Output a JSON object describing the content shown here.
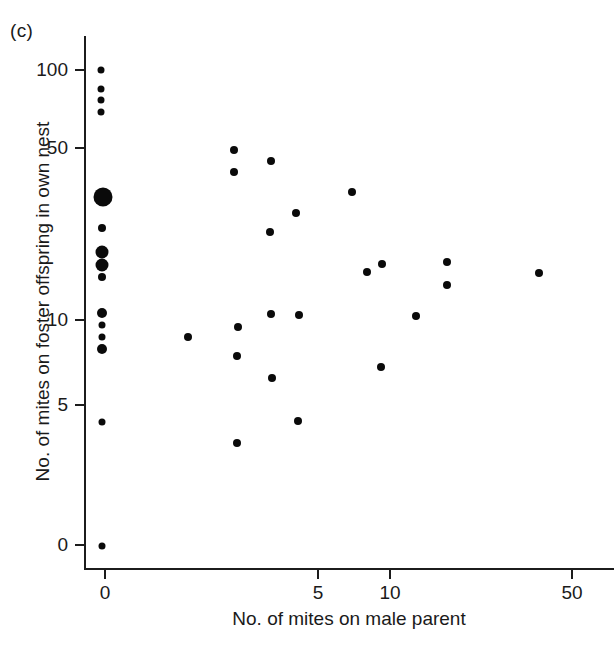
{
  "figure": {
    "panel_label": "(c)"
  },
  "chart_data": {
    "type": "scatter",
    "title": "",
    "xlabel": "No. of mites on male parent",
    "ylabel": "No. of mites on foster offspring in own nest",
    "grid": false,
    "legend": "none",
    "x_scale": "log-like (0 offset, then logarithmic)",
    "y_scale": "log-like (0 offset, then logarithmic)",
    "x_ticks": [
      "0",
      "5",
      "10",
      "50"
    ],
    "x_tick_values": [
      0,
      5,
      10,
      50
    ],
    "y_ticks": [
      "0",
      "5",
      "10",
      "50",
      "100"
    ],
    "y_tick_values": [
      0,
      5,
      10,
      50,
      100
    ],
    "xlim": [
      0,
      50
    ],
    "ylim": [
      0,
      100
    ],
    "point_color": "#0a0a0a",
    "marker_sizes_note": "Marker area encodes number of overlapping observations",
    "points": [
      {
        "x": 0,
        "y": 100,
        "n": 1,
        "px": 101,
        "py": 70,
        "r": 3.5
      },
      {
        "x": 0,
        "y": 85,
        "n": 1,
        "px": 101,
        "py": 89,
        "r": 3.5
      },
      {
        "x": 0,
        "y": 78,
        "n": 1,
        "px": 101,
        "py": 100,
        "r": 3.5
      },
      {
        "x": 0,
        "y": 71,
        "n": 1,
        "px": 101,
        "py": 112,
        "r": 3.5
      },
      {
        "x": 0,
        "y": 35,
        "n": 5,
        "px": 103,
        "py": 197,
        "r": 9.5
      },
      {
        "x": 0,
        "y": 25,
        "n": 1,
        "px": 102,
        "py": 228,
        "r": 4.0
      },
      {
        "x": 0,
        "y": 20,
        "n": 3,
        "px": 102,
        "py": 252,
        "r": 6.5
      },
      {
        "x": 0,
        "y": 18,
        "n": 3,
        "px": 102,
        "py": 265,
        "r": 6.5
      },
      {
        "x": 0,
        "y": 16,
        "n": 1,
        "px": 102,
        "py": 277,
        "r": 4.0
      },
      {
        "x": 0,
        "y": 10.5,
        "n": 2,
        "px": 102,
        "py": 313,
        "r": 5.0
      },
      {
        "x": 0,
        "y": 9.5,
        "n": 1,
        "px": 102,
        "py": 325,
        "r": 3.5
      },
      {
        "x": 0,
        "y": 8.7,
        "n": 1,
        "px": 102,
        "py": 337,
        "r": 3.5
      },
      {
        "x": 0,
        "y": 8.0,
        "n": 2,
        "px": 102,
        "py": 349,
        "r": 5.0
      },
      {
        "x": 0,
        "y": 4.4,
        "n": 1,
        "px": 102,
        "py": 422,
        "r": 3.5
      },
      {
        "x": 0,
        "y": 0,
        "n": 1,
        "px": 102,
        "py": 546,
        "r": 3.5
      },
      {
        "x": 1.9,
        "y": 9.2,
        "n": 1,
        "px": 188,
        "py": 337,
        "r": 4.0
      },
      {
        "x": 3.0,
        "y": 52,
        "n": 1,
        "px": 234,
        "py": 150,
        "r": 4.0
      },
      {
        "x": 3.0,
        "y": 43,
        "n": 1,
        "px": 234,
        "py": 172,
        "r": 4.0
      },
      {
        "x": 3.0,
        "y": 9.7,
        "n": 1,
        "px": 238,
        "py": 327,
        "r": 4.0
      },
      {
        "x": 3.0,
        "y": 8.0,
        "n": 1,
        "px": 237,
        "py": 356,
        "r": 4.0
      },
      {
        "x": 3.0,
        "y": 3.6,
        "n": 1,
        "px": 237,
        "py": 443,
        "r": 4.0
      },
      {
        "x": 3.6,
        "y": 48,
        "n": 1,
        "px": 271,
        "py": 161,
        "r": 4.0
      },
      {
        "x": 3.6,
        "y": 27,
        "n": 1,
        "px": 270,
        "py": 232,
        "r": 4.0
      },
      {
        "x": 3.6,
        "y": 10.4,
        "n": 1,
        "px": 271,
        "py": 314,
        "r": 4.0
      },
      {
        "x": 3.6,
        "y": 6.5,
        "n": 1,
        "px": 272,
        "py": 378,
        "r": 4.0
      },
      {
        "x": 4.4,
        "y": 31,
        "n": 1,
        "px": 296,
        "py": 213,
        "r": 4.0
      },
      {
        "x": 4.4,
        "y": 10.3,
        "n": 1,
        "px": 299,
        "py": 315,
        "r": 4.0
      },
      {
        "x": 4.4,
        "y": 4.4,
        "n": 1,
        "px": 298,
        "py": 421,
        "r": 4.0
      },
      {
        "x": 7.0,
        "y": 38,
        "n": 1,
        "px": 352,
        "py": 192,
        "r": 4.0
      },
      {
        "x": 9.2,
        "y": 7.2,
        "n": 1,
        "px": 381,
        "py": 367,
        "r": 4.0
      },
      {
        "x": 9.2,
        "y": 16.5,
        "n": 1,
        "px": 367,
        "py": 272,
        "r": 4.0
      },
      {
        "x": 9.6,
        "y": 18,
        "n": 1,
        "px": 382,
        "py": 264,
        "r": 4.0
      },
      {
        "x": 10.8,
        "y": 10.3,
        "n": 1,
        "px": 416,
        "py": 316,
        "r": 4.0
      },
      {
        "x": 11.6,
        "y": 18,
        "n": 1,
        "px": 447,
        "py": 262,
        "r": 4.0
      },
      {
        "x": 11.6,
        "y": 14,
        "n": 1,
        "px": 447,
        "py": 285,
        "r": 4.0
      },
      {
        "x": 14.0,
        "y": 16.5,
        "n": 1,
        "px": 539,
        "py": 273,
        "r": 4.0
      }
    ]
  },
  "axes_pixel_geometry": {
    "y_axis_x": 84,
    "x_axis_y": 568,
    "y_tick_pixels": {
      "100": 70,
      "50": 148,
      "10": 320,
      "5": 405,
      "0": 545
    },
    "x_tick_pixels": {
      "0": 105,
      "5": 318,
      "10": 390,
      "50": 572
    }
  }
}
